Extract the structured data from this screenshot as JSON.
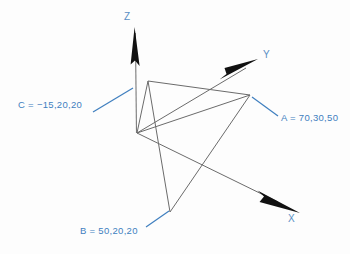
{
  "diagram": {
    "background_color": "#fdfdfd",
    "line_color": "#6b6b6b",
    "arrow_color": "#111111",
    "annotation_color": "#3f7fbf",
    "axis_label_color": "#5a8fc4",
    "axes": [
      {
        "id": "x",
        "label": "X",
        "origin": [
          137,
          133
        ],
        "tip": [
          300,
          213
        ]
      },
      {
        "id": "y",
        "label": "Y",
        "origin": [
          137,
          133
        ],
        "tip": [
          258,
          60
        ]
      },
      {
        "id": "z",
        "label": "Z",
        "origin": [
          137,
          133
        ],
        "tip": [
          135,
          27
        ]
      }
    ],
    "triangle": {
      "name": "triangle-abc",
      "vertices": [
        {
          "id": "a",
          "label": "A",
          "point": [
            250,
            95
          ]
        },
        {
          "id": "b",
          "label": "B",
          "point": [
            170,
            212
          ]
        },
        {
          "id": "c",
          "label": "C",
          "point": [
            148,
            81
          ]
        }
      ]
    },
    "annotations": [
      {
        "id": "a",
        "text": "A = 70,30,50",
        "clipped": true,
        "leader": {
          "from": [
            278,
            116
          ],
          "to": [
            252,
            97
          ]
        }
      },
      {
        "id": "b",
        "text": "B = 50,20,20",
        "clipped": false,
        "leader": {
          "from": [
            146,
            227
          ],
          "to": [
            169,
            211
          ]
        }
      },
      {
        "id": "c",
        "text": "C = −15,20,20",
        "clipped": false,
        "leader": {
          "from": [
            93,
            112
          ],
          "to": [
            133,
            88
          ]
        }
      }
    ]
  }
}
